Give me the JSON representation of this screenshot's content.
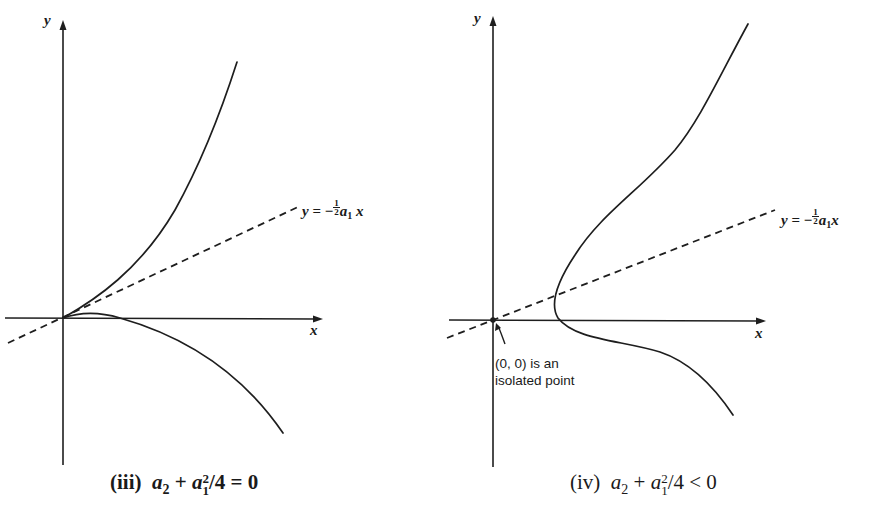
{
  "panels": [
    {
      "id": "iii",
      "caption": {
        "roman": "(iii)",
        "lhs_a2": "a",
        "lhs_a2_sub": "2",
        "plus": "+",
        "a1": "a",
        "a1_sub": "1",
        "a1_sup": "2",
        "rest": "/4",
        "relation": "=",
        "rhs": "0"
      },
      "axes": {
        "x_label": "x",
        "y_label": "y"
      },
      "dashed_line_label": {
        "y": "y",
        "equals": "=",
        "minus": "−",
        "frac_num": "1",
        "frac_den": "2",
        "a": "a",
        "a_sub": "1",
        "x": "x"
      }
    },
    {
      "id": "iv",
      "caption": {
        "roman": "(iv)",
        "lhs_a2": "a",
        "lhs_a2_sub": "2",
        "plus": "+",
        "a1": "a",
        "a1_sub": "1",
        "a1_sup": "2",
        "rest": "/4",
        "relation": "<",
        "rhs": "0"
      },
      "axes": {
        "x_label": "x",
        "y_label": "y"
      },
      "dashed_line_label": {
        "y": "y",
        "equals": "=",
        "minus": "−",
        "frac_num": "1",
        "frac_den": "2",
        "a": "a",
        "a_sub": "1",
        "x": "x"
      },
      "annotation": {
        "line1": "(0, 0) is an",
        "line2": "isolated point"
      }
    }
  ],
  "colors": {
    "ink": "#1e1e1e",
    "background": "#ffffff"
  }
}
